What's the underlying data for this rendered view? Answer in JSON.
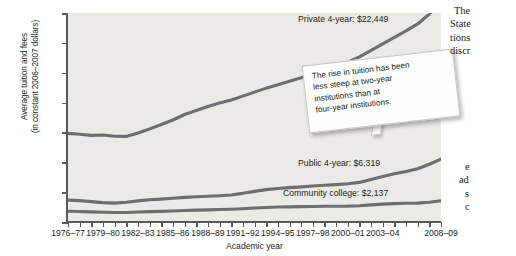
{
  "chart_data": {
    "type": "line",
    "title": "",
    "xlabel": "Academic year",
    "ylabel": "Average tuition and fees\n(in constant 2006–2007 dollars)",
    "ylabel_line1": "Average tuition and fees",
    "ylabel_line2": "(in constant 2006–2007 dollars)",
    "ylim": [
      0,
      21000
    ],
    "yticks": [
      0,
      3000,
      6000,
      9000,
      12000,
      15000,
      18000,
      21000
    ],
    "ytick_labels": [
      "0",
      "3,000",
      "6,000",
      "9,000",
      "12,000",
      "15,000",
      "18,000",
      "21,000"
    ],
    "grid": false,
    "legend_position": "inline-labels",
    "x_tick_labels": [
      "1976–77",
      "1979–80",
      "1982–83",
      "1985–86",
      "1988–89",
      "1991–92",
      "1994–95",
      "1997–98",
      "2000–01",
      "2003–04",
      "2008–09"
    ],
    "x": [
      "1976–77",
      "1977–78",
      "1978–79",
      "1979–80",
      "1980–81",
      "1981–82",
      "1982–83",
      "1983–84",
      "1984–85",
      "1985–86",
      "1986–87",
      "1987–88",
      "1988–89",
      "1989–90",
      "1990–91",
      "1991–92",
      "1992–93",
      "1993–94",
      "1994–95",
      "1995–96",
      "1996–97",
      "1997–98",
      "1998–99",
      "1999–00",
      "2000–01",
      "2001–02",
      "2002–03",
      "2003–04",
      "2004–05",
      "2005–06",
      "2006–07",
      "2007–08",
      "2008–09"
    ],
    "series": [
      {
        "name": "Private 4-year",
        "label": "Private 4-year: $22,449",
        "final_value": 22449,
        "color": "#6d6e71",
        "values": [
          8900,
          8820,
          8700,
          8740,
          8620,
          8600,
          8950,
          9350,
          9800,
          10250,
          10800,
          11200,
          11600,
          11950,
          12250,
          12650,
          13050,
          13450,
          13800,
          14150,
          14500,
          14900,
          15300,
          15650,
          16050,
          16600,
          17250,
          17900,
          18550,
          19200,
          19900,
          20900,
          22449
        ]
      },
      {
        "name": "Public 4-year",
        "label": "Public 4-year: $6,319",
        "final_value": 6319,
        "color": "#6d6e71",
        "values": [
          2200,
          2150,
          2050,
          1950,
          1900,
          1980,
          2120,
          2230,
          2300,
          2380,
          2470,
          2530,
          2580,
          2640,
          2720,
          2880,
          3080,
          3250,
          3360,
          3450,
          3530,
          3620,
          3700,
          3760,
          3840,
          3980,
          4260,
          4580,
          4850,
          5080,
          5350,
          5800,
          6319
        ]
      },
      {
        "name": "Community college",
        "label": "Community college: $2,137",
        "final_value": 2137,
        "color": "#6d6e71",
        "values": [
          1080,
          1060,
          1020,
          980,
          950,
          960,
          1000,
          1040,
          1070,
          1100,
          1150,
          1190,
          1220,
          1250,
          1280,
          1330,
          1400,
          1460,
          1500,
          1520,
          1540,
          1560,
          1580,
          1590,
          1600,
          1640,
          1720,
          1800,
          1850,
          1880,
          1900,
          1980,
          2137
        ]
      }
    ],
    "annotations": [
      {
        "name": "callout-two-year",
        "text": "The rise in tuition has been less steep at two-year institutions than at four-year institutions.",
        "lines": [
          "The rise in tuition has been",
          "less steep at two-year",
          "institutions than at",
          "four-year institutions."
        ],
        "points_to": "Community college"
      }
    ]
  },
  "body_text": {
    "top_lines": [
      "The",
      "State",
      "tions",
      "discr"
    ],
    "bottom_lines": [
      "e",
      "ad",
      "s",
      "c"
    ]
  }
}
